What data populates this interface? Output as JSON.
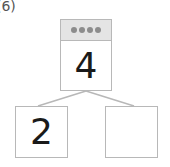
{
  "problem_label": "(6)",
  "number_bond": {
    "whole": {
      "value": "4",
      "dots": 4
    },
    "parts": [
      {
        "value": "2"
      },
      {
        "value": ""
      }
    ]
  },
  "colors": {
    "border": "#b8b8b8",
    "header_bg": "#e4e4e4",
    "dot": "#8c8c8c",
    "text": "#1a1a1a"
  }
}
